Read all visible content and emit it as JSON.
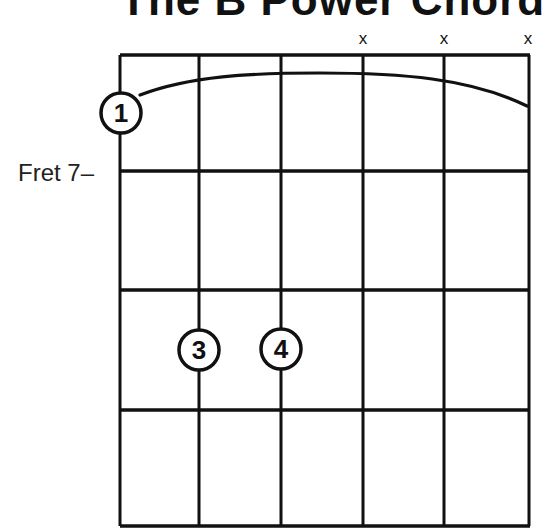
{
  "title": "The B Power Chord",
  "fret_label": "Fret 7–",
  "strings": [
    {
      "index": 1,
      "x": 120,
      "marker": ""
    },
    {
      "index": 2,
      "x": 199,
      "marker": ""
    },
    {
      "index": 3,
      "x": 281,
      "marker": ""
    },
    {
      "index": 4,
      "x": 363,
      "marker": "x"
    },
    {
      "index": 5,
      "x": 444,
      "marker": "x"
    },
    {
      "index": 6,
      "x": 529,
      "marker": "x"
    }
  ],
  "frets_y": [
    55,
    171,
    290,
    410,
    526
  ],
  "fingers": [
    {
      "label": "1",
      "string": 1,
      "x": 121,
      "y": 113
    },
    {
      "label": "3",
      "string": 2,
      "x": 199,
      "y": 350
    },
    {
      "label": "4",
      "string": 3,
      "x": 281,
      "y": 349
    }
  ],
  "barre": {
    "from_string": 1,
    "to_string": 6,
    "finger": "1"
  },
  "colors": {
    "ink": "#111111",
    "background": "#ffffff"
  }
}
